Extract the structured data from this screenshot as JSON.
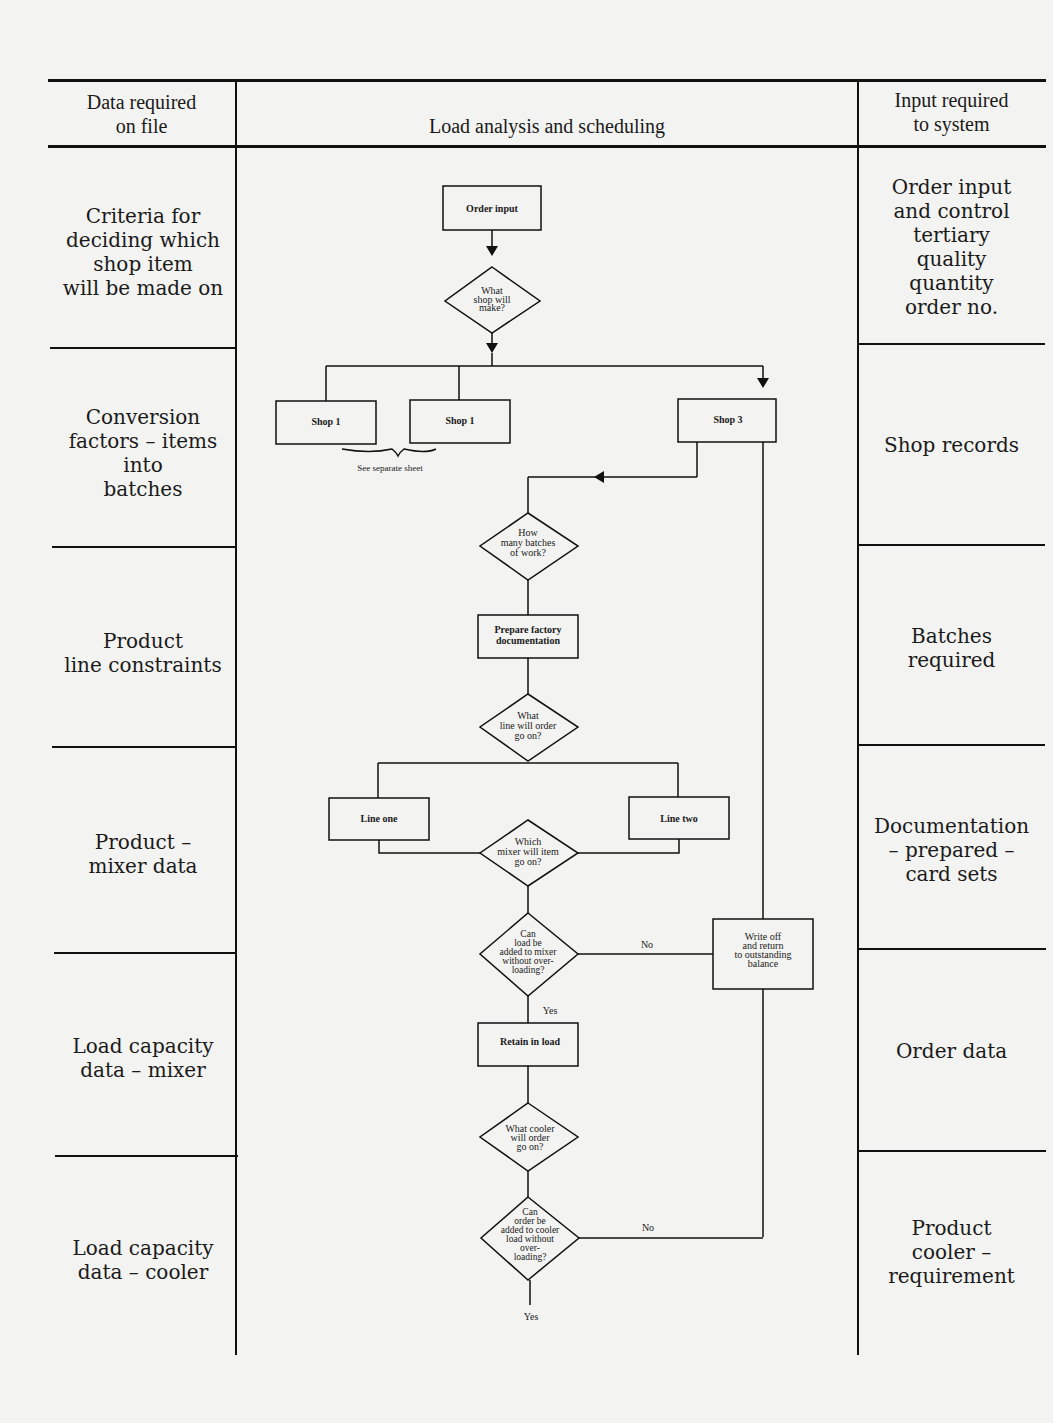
{
  "header": {
    "left_title": "Data required\non file",
    "center_title": "Load analysis and scheduling",
    "right_title": "Input required\nto system"
  },
  "left_column": [
    {
      "label": "Criteria for\ndeciding which\nshop item\nwill be made on"
    },
    {
      "label": "Conversion\nfactors – items\ninto\nbatches"
    },
    {
      "label": "Product\nline constraints"
    },
    {
      "label": "Product –\nmixer data"
    },
    {
      "label": "Load capacity\ndata – mixer"
    },
    {
      "label": "Load capacity\ndata – cooler"
    }
  ],
  "right_column": [
    {
      "label": "Order input\nand control\ntertiary\nquality\nquantity\norder no."
    },
    {
      "label": "Shop records"
    },
    {
      "label": "Batches\nrequired"
    },
    {
      "label": "Documentation\n– prepared –\ncard sets"
    },
    {
      "label": "Order data"
    },
    {
      "label": "Product\ncooler –\nrequirement"
    }
  ],
  "flowchart": {
    "order_input": "Order input",
    "what_shop": [
      "What",
      "shop will",
      "make?"
    ],
    "shop_a": "Shop 1",
    "shop_b": "Shop 1",
    "shop_3": "Shop 3",
    "see_separate": "See separate sheet",
    "how_many_batches": [
      "How",
      "many batches",
      "of work?"
    ],
    "prepare_docs": [
      "Prepare factory",
      "documentation"
    ],
    "what_line": [
      "What",
      "line will order",
      "go on?"
    ],
    "line_one": "Line one",
    "line_two": "Line two",
    "which_mixer": [
      "Which",
      "mixer will item",
      "go on?"
    ],
    "can_load_mixer": [
      "Can",
      "load be",
      "added to mixer",
      "without over-",
      "loading?"
    ],
    "write_off": [
      "Write off",
      "and return",
      "to outstanding",
      "balance"
    ],
    "retain_load": "Retain in load",
    "what_cooler": [
      "What cooler",
      "will order",
      "go on?"
    ],
    "can_order_cooler": [
      "Can",
      "order be",
      "added to cooler",
      "load without",
      "over-",
      "loading?"
    ],
    "no_1": "No",
    "no_2": "No",
    "yes_1": "Yes",
    "yes_2": "Yes"
  }
}
